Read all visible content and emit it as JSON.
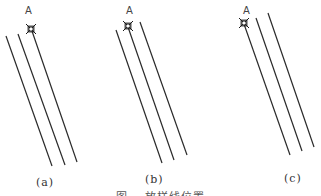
{
  "figure": {
    "caption": "图    放样线位置",
    "panels": [
      {
        "id": "a",
        "label": "(a)",
        "label_pos": [
          36,
          176
        ],
        "point": {
          "name": "A",
          "label_pos": [
            25,
            5
          ],
          "marker": [
            31,
            29
          ]
        },
        "lines": [
          {
            "x1": 6,
            "y1": 36,
            "x2": 52,
            "y2": 166
          },
          {
            "x1": 18,
            "y1": 34,
            "x2": 65,
            "y2": 165
          },
          {
            "x1": 32,
            "y1": 31,
            "x2": 77,
            "y2": 162
          }
        ]
      },
      {
        "id": "b",
        "label": "(b)",
        "label_pos": [
          145,
          173
        ],
        "point": {
          "name": "A",
          "label_pos": [
            126,
            5
          ],
          "marker": [
            128,
            26
          ]
        },
        "lines": [
          {
            "x1": 116,
            "y1": 30,
            "x2": 162,
            "y2": 163
          },
          {
            "x1": 128,
            "y1": 27,
            "x2": 174,
            "y2": 160
          },
          {
            "x1": 140,
            "y1": 22,
            "x2": 187,
            "y2": 155
          }
        ]
      },
      {
        "id": "c",
        "label": "(c)",
        "label_pos": [
          284,
          172
        ],
        "point": {
          "name": "A",
          "label_pos": [
            243,
            5
          ],
          "marker": [
            244,
            23
          ]
        },
        "lines": [
          {
            "x1": 244,
            "y1": 24,
            "x2": 290,
            "y2": 155
          },
          {
            "x1": 256,
            "y1": 18,
            "x2": 302,
            "y2": 151
          },
          {
            "x1": 268,
            "y1": 13,
            "x2": 314,
            "y2": 147
          }
        ]
      }
    ]
  },
  "colors": {
    "line": "#2a2a2a",
    "marker": "#1a1a1a",
    "text": "#444444"
  }
}
